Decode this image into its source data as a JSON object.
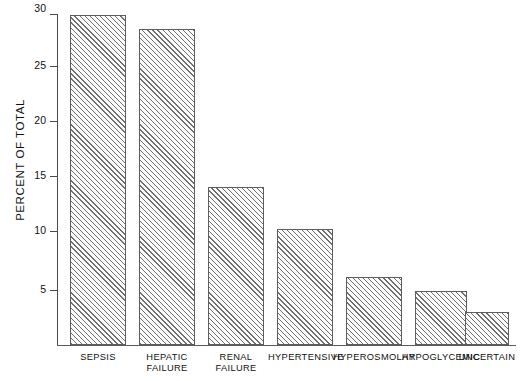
{
  "chart_data": {
    "type": "bar",
    "title": "",
    "xlabel": "",
    "ylabel": "PERCENT OF TOTAL",
    "ylim": [
      0,
      30
    ],
    "yticks": [
      5,
      10,
      15,
      20,
      25,
      30
    ],
    "ytick_labels": [
      "5",
      "10",
      "15",
      "20",
      "25",
      "30"
    ],
    "grid": false,
    "legend": null,
    "categories": [
      "SEPSIS",
      "HEPATIC\nFAILURE",
      "RENAL\nFAILURE",
      "HYPERTENSIVE",
      "HYPEROSMOLAR",
      "HYPOGLYCEMIC",
      "UNCERTAIN"
    ],
    "values": [
      29.9,
      28.6,
      14.3,
      10.5,
      6.2,
      4.9,
      3.0
    ],
    "bar_style": {
      "fill": "#fbfbfb",
      "hatch": "diagonal-45",
      "hatch_color": "#6f6f6f",
      "edge_color": "#5d5d5d"
    },
    "axis_color": "#4a4a4a",
    "background": "#ffffff"
  },
  "labels": {
    "cat_0_line1": "SEPSIS",
    "cat_0_line2": "",
    "cat_1_line1": "HEPATIC",
    "cat_1_line2": "FAILURE",
    "cat_2_line1": "RENAL",
    "cat_2_line2": "FAILURE",
    "cat_3_line1": "HYPERTENSIVE",
    "cat_3_line2": "",
    "cat_4_line1": "HYPEROSMOLAR",
    "cat_4_line2": "",
    "cat_5_line1": "HYPOGLYCEMIC",
    "cat_5_line2": "",
    "cat_6_line1": "UNCERTAIN",
    "cat_6_line2": "",
    "ytick_0": "5",
    "ytick_1": "10",
    "ytick_2": "15",
    "ytick_3": "20",
    "ytick_4": "25",
    "ytick_5": "30",
    "yaxis_title": "PERCENT OF TOTAL"
  }
}
